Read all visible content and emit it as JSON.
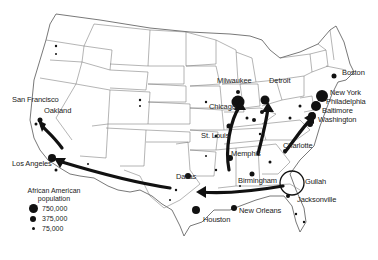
{
  "map": {
    "title": "",
    "legend": {
      "title_line1": "African American",
      "title_line2": "population",
      "items": [
        {
          "label": "750,000",
          "size": 9
        },
        {
          "label": "375,000",
          "size": 6
        },
        {
          "label": "75,000",
          "size": 3
        }
      ]
    },
    "cities": {
      "san_francisco": "San Francisco",
      "oakland": "Oakland",
      "los_angeles": "Los Angeles",
      "milwaukee": "Milwaukee",
      "detroit": "Detroit",
      "chicago": "Chicago",
      "st_louis": "St. Louis",
      "memphis": "Memphis",
      "birmingham": "Birmingham",
      "charlotte": "Charlotte",
      "boston": "Boston",
      "new_york": "New York",
      "philadelphia": "Philadelphia",
      "baltimore": "Baltimore",
      "washington": "Washington",
      "dallas": "Dallas",
      "houston": "Houston",
      "new_orleans": "New Orleans",
      "jacksonville": "Jacksonville",
      "gullah": "Gullah"
    },
    "colors": {
      "ink": "#111111",
      "border": "#555555",
      "background": "#ffffff"
    }
  }
}
